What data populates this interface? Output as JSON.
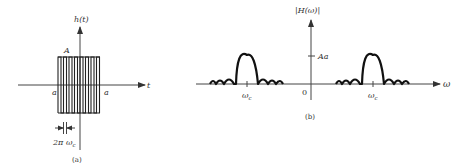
{
  "panel_a": {
    "y_axis_label": "h(t)",
    "x_axis_label": "t",
    "amplitude_label": "A",
    "left_bound_label": "a",
    "right_bound_label": "a",
    "period_label": "2π ω",
    "period_subscript": "c",
    "caption": "(a)",
    "pulse_count": 8
  },
  "panel_b": {
    "y_axis_label": "|H(ω)|",
    "x_axis_label": "ω",
    "peak_label": "Aa",
    "origin_label": "0",
    "left_center_label": "ω",
    "left_center_subscript": "c",
    "right_center_label": "ω",
    "right_center_subscript": "c",
    "caption": "(b)"
  }
}
